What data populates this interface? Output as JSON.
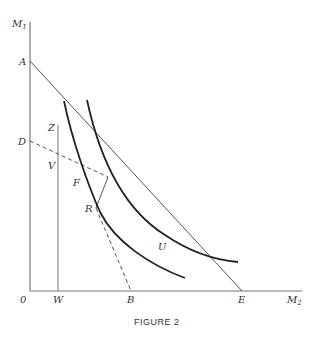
{
  "figure": {
    "caption": "FIGURE 2",
    "axes": {
      "y_label": "M",
      "y_label_sub": "1",
      "x_label": "M",
      "x_label_sub": "2",
      "origin": "0"
    },
    "points": {
      "A": "A",
      "D": "D",
      "Z": "Z",
      "V": "V",
      "F": "F",
      "R": "R",
      "U": "U",
      "W": "W",
      "B": "B",
      "E": "E"
    },
    "lines": [
      {
        "name": "AE",
        "style": "solid",
        "from": "A",
        "to": "E"
      },
      {
        "name": "DB",
        "style": "dashed with solid segment FR",
        "from": "D",
        "to": "B"
      },
      {
        "name": "WZ",
        "style": "solid vertical",
        "from": "W",
        "to": "Z"
      }
    ],
    "curves": [
      {
        "name": "inner-indifference-curve",
        "through": [
          "F",
          "R"
        ]
      },
      {
        "name": "outer-indifference-curve",
        "tangent_at": "U"
      }
    ],
    "colors": {
      "ink": "#333333",
      "axis": "#777777",
      "background": "#ffffff"
    }
  }
}
